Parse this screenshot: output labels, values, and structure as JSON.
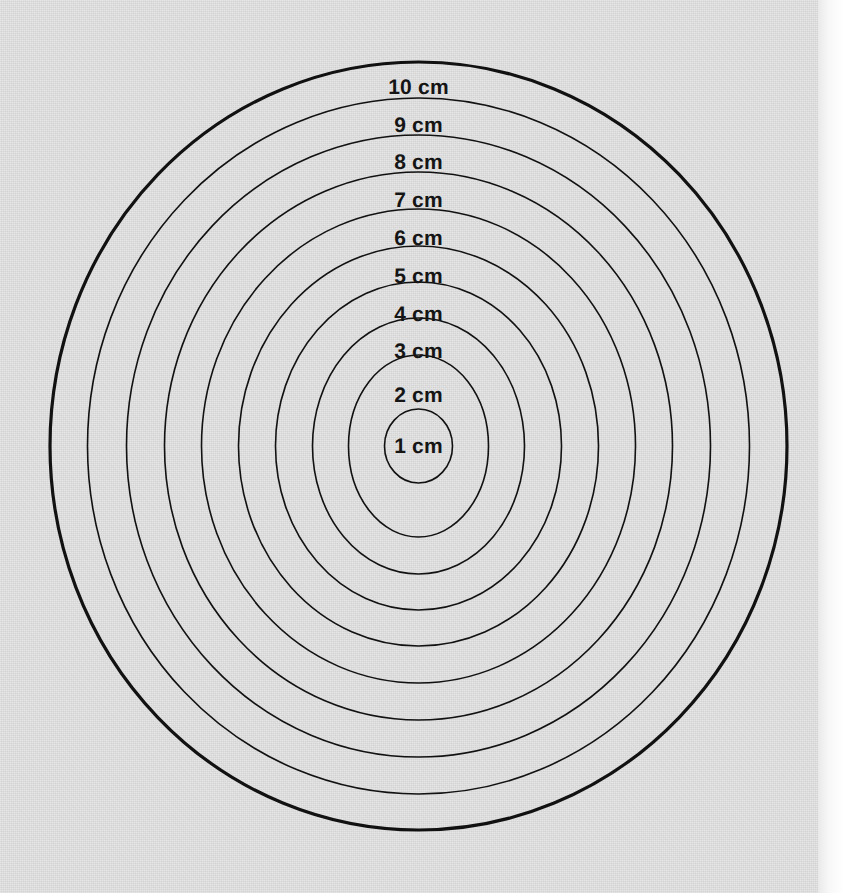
{
  "page": {
    "width": 844,
    "height": 893,
    "background_color": "#ffffff",
    "sheet_color": "#dcdcdc",
    "sheet_width": 818,
    "margin_strip_color": "#ffffff"
  },
  "chart_data": {
    "type": "pie",
    "title": "",
    "subtitle": "",
    "xlabel": "",
    "ylabel": "",
    "legend_position": "none",
    "grid": false,
    "units": "cm",
    "center": {
      "x": 418.5,
      "y": 446
    },
    "stroke_color": "#111111",
    "fill_color": "none",
    "categories": [
      "1 cm",
      "2 cm",
      "3 cm",
      "4 cm",
      "5 cm",
      "6 cm",
      "7 cm",
      "8 cm",
      "9 cm",
      "10 cm"
    ],
    "values": [
      1,
      2,
      3,
      4,
      5,
      6,
      7,
      8,
      9,
      10
    ],
    "series": [
      {
        "name": "radius_cm",
        "values": [
          1,
          2,
          3,
          4,
          5,
          6,
          7,
          8,
          9,
          10
        ]
      },
      {
        "name": "radius_px_x",
        "values": [
          34,
          70,
          106,
          143,
          180,
          217,
          254,
          292,
          331,
          368.5
        ]
      },
      {
        "name": "radius_px_y",
        "values": [
          37,
          91,
          128,
          164,
          200,
          237,
          274,
          311,
          348,
          384
        ]
      }
    ],
    "rings": [
      {
        "label": "1 cm",
        "cm": 1,
        "rx": 34,
        "ry": 37,
        "stroke_width": 1.6,
        "label_x": 418.5,
        "label_y": 447
      },
      {
        "label": "2 cm",
        "cm": 2,
        "rx": 70,
        "ry": 91,
        "stroke_width": 1.6,
        "label_x": 418.5,
        "label_y": 396
      },
      {
        "label": "3 cm",
        "cm": 3,
        "rx": 106,
        "ry": 128,
        "stroke_width": 1.6,
        "label_x": 418.5,
        "label_y": 352
      },
      {
        "label": "4 cm",
        "cm": 4,
        "rx": 143,
        "ry": 164,
        "stroke_width": 1.6,
        "label_x": 418.5,
        "label_y": 315
      },
      {
        "label": "5 cm",
        "cm": 5,
        "rx": 180,
        "ry": 200,
        "stroke_width": 1.6,
        "label_x": 418.5,
        "label_y": 277
      },
      {
        "label": "6 cm",
        "cm": 6,
        "rx": 217,
        "ry": 237,
        "stroke_width": 1.6,
        "label_x": 418.5,
        "label_y": 239
      },
      {
        "label": "7 cm",
        "cm": 7,
        "rx": 254,
        "ry": 274,
        "stroke_width": 1.6,
        "label_x": 418.5,
        "label_y": 201
      },
      {
        "label": "8 cm",
        "cm": 8,
        "rx": 292,
        "ry": 311,
        "stroke_width": 1.6,
        "label_x": 418.5,
        "label_y": 163
      },
      {
        "label": "9 cm",
        "cm": 9,
        "rx": 331,
        "ry": 348,
        "stroke_width": 1.6,
        "label_x": 418.5,
        "label_y": 126
      },
      {
        "label": "10 cm",
        "cm": 10,
        "rx": 368.5,
        "ry": 384,
        "stroke_width": 3.2,
        "label_x": 418.5,
        "label_y": 88
      }
    ],
    "axis_ranges": {
      "x": [
        50,
        787
      ],
      "y": [
        62,
        830
      ]
    }
  }
}
